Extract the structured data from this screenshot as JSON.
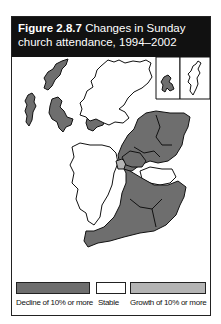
{
  "figure": {
    "label": "Figure 2.8.7",
    "title": "Changes in Sunday church attendance, 1994–2002"
  },
  "legend": [
    {
      "label": "Decline of 10% or more",
      "color": "#6e6e6e"
    },
    {
      "label": "Stable",
      "color": "#ffffff"
    },
    {
      "label": "Growth of 10% or more",
      "color": "#b4b4b4"
    }
  ],
  "colors": {
    "decline": "#6e6e6e",
    "stable": "#ffffff",
    "growth": "#b4b4b4",
    "title_bg": "#111111"
  }
}
